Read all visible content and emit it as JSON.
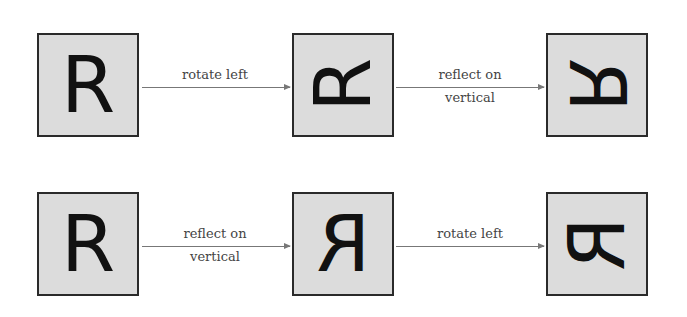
{
  "diagram": {
    "rows": [
      {
        "boxes": [
          {
            "glyph": "R",
            "transform": "original"
          },
          {
            "glyph": "R",
            "transform": "rotated left"
          },
          {
            "glyph": "R",
            "transform": "rotated left then reflected on vertical"
          }
        ],
        "arrows": [
          {
            "label_line1": "rotate left",
            "label_line2": ""
          },
          {
            "label_line1": "reflect on",
            "label_line2": "vertical"
          }
        ]
      },
      {
        "boxes": [
          {
            "glyph": "R",
            "transform": "original"
          },
          {
            "glyph": "R",
            "transform": "reflected on vertical"
          },
          {
            "glyph": "R",
            "transform": "reflected on vertical then rotated left"
          }
        ],
        "arrows": [
          {
            "label_line1": "reflect on",
            "label_line2": "vertical"
          },
          {
            "label_line1": "rotate left",
            "label_line2": ""
          }
        ]
      }
    ],
    "colors": {
      "box_fill": "#dcdcdc",
      "box_border": "#2a2a2a",
      "arrow": "#777777",
      "label": "#444444"
    }
  }
}
